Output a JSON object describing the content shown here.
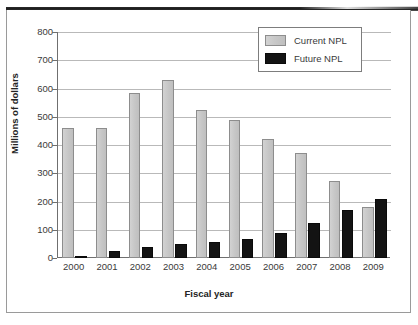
{
  "chart_data": {
    "type": "bar",
    "title": "",
    "xlabel": "Fiscal year",
    "ylabel": "Millions of dollars",
    "categories": [
      "2000",
      "2001",
      "2002",
      "2003",
      "2004",
      "2005",
      "2006",
      "2007",
      "2008",
      "2009"
    ],
    "series": [
      {
        "name": "Current NPL",
        "color": "#c6c6c6",
        "values": [
          462,
          461,
          583,
          631,
          524,
          487,
          422,
          370,
          272,
          180
        ]
      },
      {
        "name": "Future NPL",
        "color": "#131313",
        "values": [
          8,
          25,
          38,
          48,
          58,
          66,
          88,
          125,
          171,
          209
        ]
      }
    ],
    "ylim": [
      0,
      800
    ],
    "yticks": [
      "0",
      "100",
      "200",
      "300",
      "400",
      "500",
      "600",
      "700",
      "800"
    ],
    "ytick_values": [
      0,
      100,
      200,
      300,
      400,
      500,
      600,
      700,
      800
    ],
    "grid": true,
    "legend_position": "top-right"
  },
  "legend": {
    "entries": [
      {
        "label": "Current NPL",
        "swatch": "current"
      },
      {
        "label": "Future NPL",
        "swatch": "future"
      }
    ]
  }
}
